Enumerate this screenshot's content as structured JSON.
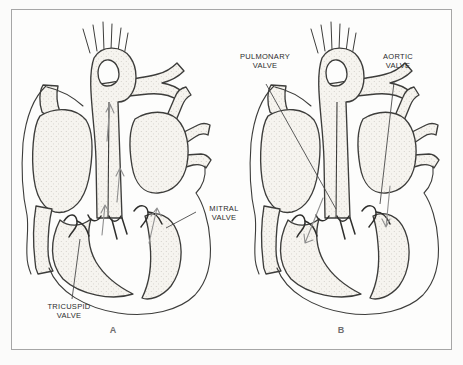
{
  "figure": {
    "type": "heart-valves-cross-section-diagram",
    "panels": {
      "a": {
        "letter": "A",
        "labels": {
          "tricuspid": {
            "line1": "TRICUSPID",
            "line2": "VALVE"
          },
          "mitral": {
            "line1": "MITRAL",
            "line2": "VALVE"
          }
        }
      },
      "b": {
        "letter": "B",
        "labels": {
          "pulmonary": {
            "line1": "PULMONARY",
            "line2": "VALVE"
          },
          "aortic": {
            "line1": "AORTIC",
            "line2": "VALVE"
          }
        }
      }
    },
    "colors": {
      "ink": "#3d3d3b",
      "valve_ink": "#2f2f2d",
      "label_text": "#2b2b2b",
      "panel_letter": "#6f6f6f",
      "frame_border": "#a6a6a6",
      "paper": "#fdfdfc",
      "stipple_background": "#f6f4ef",
      "stipple_dot": "#a49f97",
      "flow_arrow": "#8f8f8f",
      "leader_line": "#4a4a4a"
    }
  }
}
